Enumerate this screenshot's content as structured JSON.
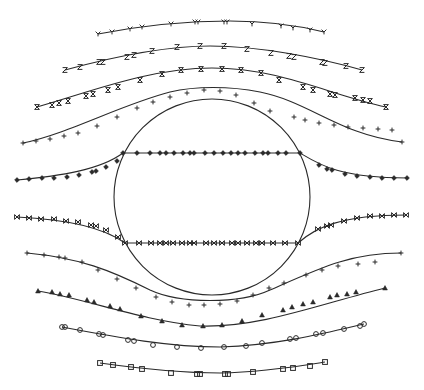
{
  "figure": {
    "background": "#ffffff",
    "line_color": "#2a2a2a",
    "obstacle": {
      "shape": "circle",
      "cx": 212,
      "cy": 197,
      "r": 98
    },
    "streamlines": [
      {
        "id": "s1",
        "marker": "Y",
        "path": "M98,34 C150,24 190,21 230,21 C270,21 300,26 324,32",
        "points": [
          [
            98,
            34
          ],
          [
            112,
            32
          ],
          [
            130,
            29
          ],
          [
            142,
            27
          ],
          [
            171,
            24
          ],
          [
            195,
            22
          ],
          [
            198,
            22
          ],
          [
            224,
            22
          ],
          [
            227,
            22
          ],
          [
            252,
            24
          ],
          [
            281,
            26
          ],
          [
            293,
            28
          ],
          [
            310,
            30
          ],
          [
            324,
            32
          ]
        ]
      },
      {
        "id": "s2",
        "marker": "Z",
        "path": "M65,70 C120,55 170,46 210,46 C260,46 320,58 362,70",
        "points": [
          [
            65,
            70
          ],
          [
            80,
            67
          ],
          [
            99,
            62
          ],
          [
            103,
            62
          ],
          [
            127,
            57
          ],
          [
            134,
            55
          ],
          [
            152,
            51
          ],
          [
            177,
            47
          ],
          [
            200,
            46
          ],
          [
            224,
            46
          ],
          [
            247,
            49
          ],
          [
            271,
            53
          ],
          [
            289,
            56
          ],
          [
            294,
            57
          ],
          [
            322,
            62
          ],
          [
            325,
            63
          ],
          [
            346,
            66
          ],
          [
            362,
            70
          ]
        ]
      },
      {
        "id": "s3",
        "marker": "X",
        "path": "M37,107 C90,92 150,68 212,68 C280,68 330,95 386,107",
        "points": [
          [
            37,
            107
          ],
          [
            52,
            105
          ],
          [
            59,
            103
          ],
          [
            68,
            101
          ],
          [
            86,
            96
          ],
          [
            93,
            94
          ],
          [
            108,
            90
          ],
          [
            118,
            87
          ],
          [
            140,
            80
          ],
          [
            162,
            74
          ],
          [
            181,
            70
          ],
          [
            201,
            69
          ],
          [
            222,
            69
          ],
          [
            241,
            70
          ],
          [
            261,
            73
          ],
          [
            279,
            80
          ],
          [
            303,
            87
          ],
          [
            313,
            90
          ],
          [
            330,
            94
          ],
          [
            335,
            95
          ],
          [
            355,
            98
          ],
          [
            363,
            100
          ],
          [
            370,
            101
          ],
          [
            386,
            107
          ]
        ]
      },
      {
        "id": "s4",
        "marker": "+",
        "path": "M23,143 C70,133 120,105 170,92 C195,86 230,86 260,92 C310,102 340,135 402,142",
        "points": [
          [
            23,
            143
          ],
          [
            36,
            141
          ],
          [
            50,
            139
          ],
          [
            64,
            136
          ],
          [
            78,
            133
          ],
          [
            97,
            126
          ],
          [
            117,
            117
          ],
          [
            137,
            108
          ],
          [
            153,
            102
          ],
          [
            170,
            97
          ],
          [
            187,
            93
          ],
          [
            204,
            90
          ],
          [
            220,
            91
          ],
          [
            236,
            95
          ],
          [
            254,
            103
          ],
          [
            270,
            111
          ],
          [
            294,
            117
          ],
          [
            305,
            120
          ],
          [
            319,
            123
          ],
          [
            334,
            125
          ],
          [
            348,
            127
          ],
          [
            363,
            128
          ],
          [
            378,
            129
          ],
          [
            392,
            130
          ],
          [
            402,
            142
          ]
        ]
      },
      {
        "id": "s5",
        "marker": "diamond",
        "path": "M17,180 C60,176 100,170 123,153 L300,153 C320,165 340,178 407,178",
        "points": [
          [
            17,
            180
          ],
          [
            29,
            179
          ],
          [
            42,
            178
          ],
          [
            54,
            178
          ],
          [
            67,
            177
          ],
          [
            79,
            175
          ],
          [
            92,
            172
          ],
          [
            96,
            171
          ],
          [
            106,
            167
          ],
          [
            117,
            161
          ],
          [
            123,
            153
          ],
          [
            137,
            153
          ],
          [
            150,
            153
          ],
          [
            160,
            153
          ],
          [
            166,
            153
          ],
          [
            174,
            153
          ],
          [
            183,
            153
          ],
          [
            190,
            153
          ],
          [
            194,
            153
          ],
          [
            205,
            153
          ],
          [
            214,
            153
          ],
          [
            223,
            153
          ],
          [
            231,
            153
          ],
          [
            238,
            153
          ],
          [
            245,
            153
          ],
          [
            255,
            153
          ],
          [
            263,
            153
          ],
          [
            268,
            153
          ],
          [
            278,
            153
          ],
          [
            286,
            153
          ],
          [
            300,
            153
          ],
          [
            319,
            165
          ],
          [
            327,
            169
          ],
          [
            332,
            170
          ],
          [
            345,
            174
          ],
          [
            357,
            176
          ],
          [
            370,
            177
          ],
          [
            382,
            178
          ],
          [
            394,
            178
          ],
          [
            407,
            178
          ]
        ]
      },
      {
        "id": "s6",
        "marker": "hourglass",
        "path": "M17,217 C60,219 100,225 125,243 L298,243 C315,228 340,215 406,215",
        "points": [
          [
            17,
            217
          ],
          [
            29,
            218
          ],
          [
            41,
            219
          ],
          [
            54,
            219
          ],
          [
            66,
            221
          ],
          [
            78,
            222
          ],
          [
            91,
            225
          ],
          [
            96,
            226
          ],
          [
            106,
            230
          ],
          [
            118,
            237
          ],
          [
            125,
            243
          ],
          [
            139,
            243
          ],
          [
            151,
            243
          ],
          [
            160,
            243
          ],
          [
            166,
            243
          ],
          [
            173,
            243
          ],
          [
            182,
            243
          ],
          [
            190,
            243
          ],
          [
            194,
            243
          ],
          [
            206,
            243
          ],
          [
            214,
            243
          ],
          [
            222,
            243
          ],
          [
            232,
            243
          ],
          [
            238,
            243
          ],
          [
            247,
            243
          ],
          [
            256,
            243
          ],
          [
            262,
            243
          ],
          [
            273,
            243
          ],
          [
            285,
            243
          ],
          [
            298,
            243
          ],
          [
            318,
            229
          ],
          [
            327,
            226
          ],
          [
            331,
            225
          ],
          [
            344,
            221
          ],
          [
            357,
            218
          ],
          [
            370,
            216
          ],
          [
            382,
            216
          ],
          [
            394,
            215
          ],
          [
            406,
            215
          ]
        ]
      },
      {
        "id": "s7",
        "marker": "+",
        "path": "M27,253 C80,258 110,270 150,290 C180,304 240,304 270,290 C320,268 350,253 401,253",
        "points": [
          [
            27,
            253
          ],
          [
            44,
            255
          ],
          [
            59,
            257
          ],
          [
            65,
            258
          ],
          [
            82,
            262
          ],
          [
            98,
            270
          ],
          [
            117,
            279
          ],
          [
            136,
            288
          ],
          [
            156,
            297
          ],
          [
            172,
            302
          ],
          [
            189,
            305
          ],
          [
            204,
            305
          ],
          [
            220,
            304
          ],
          [
            237,
            301
          ],
          [
            253,
            295
          ],
          [
            269,
            288
          ],
          [
            284,
            283
          ],
          [
            306,
            275
          ],
          [
            322,
            270
          ],
          [
            338,
            266
          ],
          [
            358,
            264
          ],
          [
            375,
            262
          ],
          [
            401,
            253
          ]
        ]
      },
      {
        "id": "s8",
        "marker": "triangle",
        "path": "M38,291 C90,300 140,320 200,326 C260,328 320,304 385,288",
        "points": [
          [
            38,
            291
          ],
          [
            52,
            292
          ],
          [
            60,
            294
          ],
          [
            69,
            295
          ],
          [
            87,
            300
          ],
          [
            94,
            302
          ],
          [
            110,
            306
          ],
          [
            120,
            309
          ],
          [
            141,
            316
          ],
          [
            162,
            321
          ],
          [
            182,
            325
          ],
          [
            203,
            326
          ],
          [
            222,
            325
          ],
          [
            242,
            321
          ],
          [
            262,
            315
          ],
          [
            283,
            310
          ],
          [
            292,
            307
          ],
          [
            303,
            304
          ],
          [
            313,
            302
          ],
          [
            330,
            297
          ],
          [
            337,
            295
          ],
          [
            347,
            294
          ],
          [
            356,
            292
          ],
          [
            385,
            288
          ]
        ]
      },
      {
        "id": "s9",
        "marker": "octagon",
        "path": "M62,327 C120,338 170,347 220,347 C280,345 330,332 364,324",
        "points": [
          [
            62,
            327
          ],
          [
            65,
            327
          ],
          [
            80,
            330
          ],
          [
            99,
            334
          ],
          [
            103,
            335
          ],
          [
            128,
            340
          ],
          [
            134,
            341
          ],
          [
            153,
            345
          ],
          [
            177,
            347
          ],
          [
            201,
            348
          ],
          [
            224,
            347
          ],
          [
            246,
            346
          ],
          [
            262,
            343
          ],
          [
            290,
            339
          ],
          [
            296,
            338
          ],
          [
            316,
            334
          ],
          [
            323,
            333
          ],
          [
            344,
            329
          ],
          [
            360,
            326
          ],
          [
            364,
            324
          ]
        ]
      },
      {
        "id": "s10",
        "marker": "square",
        "path": "M100,363 C150,370 190,373 220,373 C265,372 300,366 325,362",
        "points": [
          [
            100,
            363
          ],
          [
            113,
            365
          ],
          [
            131,
            367
          ],
          [
            142,
            369
          ],
          [
            171,
            373
          ],
          [
            197,
            374
          ],
          [
            200,
            374
          ],
          [
            225,
            374
          ],
          [
            228,
            374
          ],
          [
            253,
            372
          ],
          [
            283,
            369
          ],
          [
            293,
            368
          ],
          [
            310,
            366
          ],
          [
            325,
            362
          ]
        ]
      }
    ]
  }
}
